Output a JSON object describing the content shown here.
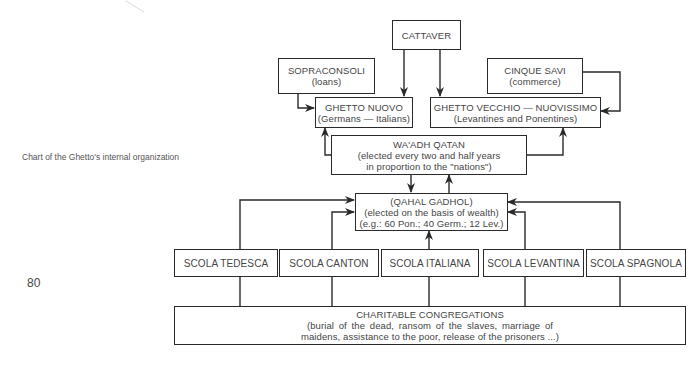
{
  "caption": "Chart of the Ghetto's internal organization",
  "page_number": "80",
  "nodes": {
    "cattaver": {
      "title": "CATTAVER"
    },
    "sopraconsoli": {
      "title": "SOPRACONSOLI",
      "subtitle": "(loans)"
    },
    "cinque_savi": {
      "title": "CINQUE SAVI",
      "subtitle": "(commerce)"
    },
    "ghetto_nuovo": {
      "title": "GHETTO NUOVO",
      "subtitle": "(Germans — Italians)"
    },
    "ghetto_vecchio": {
      "title": "GHETTO VECCHIO — NUOVISSIMO",
      "subtitle": "(Levantines and Ponentines)"
    },
    "waadh_qatan": {
      "title": "WA'ADH QATAN",
      "line2": "(elected every two and half years",
      "line3": "in proportion to the \"nations\")"
    },
    "qahal_gadhol": {
      "title": "(QAHAL GADHOL)",
      "line2": "(elected on the basis of wealth)",
      "line3": "(e.g.: 60 Pon.; 40 Germ.; 12 Lev.)"
    },
    "scolas": [
      {
        "title": "SCOLA TEDESCA"
      },
      {
        "title": "SCOLA CANTON"
      },
      {
        "title": "SCOLA ITALIANA"
      },
      {
        "title": "SCOLA LEVANTINA"
      },
      {
        "title": "SCOLA SPAGNOLA"
      }
    ],
    "charitable": {
      "title": "CHARITABLE CONGREGATIONS",
      "line2": "(burial of the dead, ransom of the slaves, marriage of",
      "line3": "maidens, assistance to the poor, release of the prisoners ...)"
    }
  },
  "edges": [
    {
      "from": "cattaver",
      "to": "ghetto_nuovo"
    },
    {
      "from": "cattaver",
      "to": "ghetto_vecchio"
    },
    {
      "from": "sopraconsoli",
      "to": "ghetto_nuovo"
    },
    {
      "from": "cinque_savi",
      "to": "ghetto_vecchio"
    },
    {
      "from": "waadh_qatan",
      "to": "ghetto_nuovo"
    },
    {
      "from": "waadh_qatan",
      "to": "ghetto_vecchio"
    },
    {
      "from": "waadh_qatan",
      "to": "qahal_gadhol"
    },
    {
      "from": "qahal_gadhol",
      "to": "waadh_qatan"
    },
    {
      "from": "scola_tedesca",
      "to": "qahal_gadhol"
    },
    {
      "from": "scola_canton",
      "to": "qahal_gadhol"
    },
    {
      "from": "scola_italiana",
      "to": "qahal_gadhol"
    },
    {
      "from": "scola_levantina",
      "to": "qahal_gadhol"
    },
    {
      "from": "scola_spagnola",
      "to": "qahal_gadhol"
    },
    {
      "from": "charitable",
      "to": "scolas"
    }
  ],
  "colors": {
    "line": "#2a2a2a",
    "text": "#444444",
    "background": "#ffffff"
  }
}
